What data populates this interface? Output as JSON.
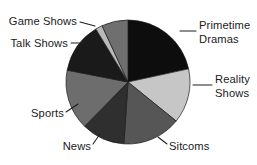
{
  "chart_data": {
    "type": "pie",
    "title": "",
    "subtitle": "",
    "xlabel": "",
    "ylabel": "",
    "legend_position": "none",
    "labels_position": "outside-with-leader-lines",
    "grid": false,
    "start_angle_deg": 0,
    "direction": "clockwise",
    "center": {
      "x": 128,
      "y": 82
    },
    "radius": 62,
    "categories": [
      "Primetime Dramas",
      "Reality Shows",
      "Sitcoms",
      "News",
      "Sports",
      "Talk Shows",
      "Game Shows"
    ],
    "values": [
      22,
      14.5,
      15.5,
      11.5,
      16,
      13.5,
      7
    ],
    "angles_deg": [
      79.2,
      52.2,
      55.8,
      41.4,
      57.6,
      48.6,
      25.2
    ],
    "colors": [
      "#0d0d0d",
      "#c6c6c6",
      "#565656",
      "#2f2f2f",
      "#6d6d6d",
      "#1a1a1a",
      "#6f6f6f"
    ],
    "slices": [
      {
        "label": "Primetime Dramas",
        "value": 22,
        "angle_deg": 79.2,
        "color": "#0d0d0d",
        "color_name": "near-black"
      },
      {
        "label": "Reality Shows",
        "value": 14.5,
        "angle_deg": 52.2,
        "color": "#c6c6c6",
        "color_name": "light-gray"
      },
      {
        "label": "Sitcoms",
        "value": 15.5,
        "angle_deg": 55.8,
        "color": "#565656",
        "color_name": "medium-dark-gray"
      },
      {
        "label": "News",
        "value": 11.5,
        "angle_deg": 41.4,
        "color": "#2f2f2f",
        "color_name": "dark-gray"
      },
      {
        "label": "Sports",
        "value": 16,
        "angle_deg": 57.6,
        "color": "#6d6d6d",
        "color_name": "medium-gray"
      },
      {
        "label": "Talk Shows",
        "value": 13.5,
        "angle_deg": 48.6,
        "color": "#1a1a1a",
        "color_name": "near-black"
      },
      {
        "label": "Game Shows",
        "value": 7,
        "angle_deg": 25.2,
        "color": "#6f6f6f",
        "color_name": "medium-gray"
      }
    ],
    "accent_sliver": {
      "color": "#b9b9b9",
      "angle_deg": 6.5
    }
  },
  "labels": {
    "primetime_dramas_line1": "Primetime",
    "primetime_dramas_line2": "Dramas",
    "reality_shows_line1": "Reality",
    "reality_shows_line2": "Shows",
    "sitcoms": "Sitcoms",
    "news": "News",
    "sports": "Sports",
    "talk_shows": "Talk Shows",
    "game_shows": "Game Shows"
  }
}
